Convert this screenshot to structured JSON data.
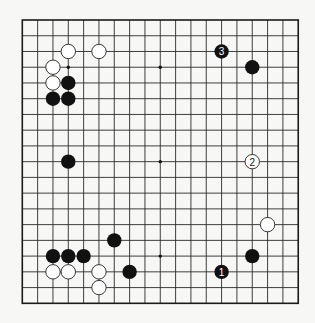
{
  "board": {
    "size": 19,
    "origin_x": 22.3,
    "origin_y": 20.0,
    "spacing_x": 15.33,
    "spacing_y": 15.74,
    "stone_radius": 7.2,
    "colors": {
      "background": "#f7f7f5",
      "line": "#2a2a2a",
      "black_stone": "#111111",
      "white_stone": "#ffffff"
    },
    "star_points": [
      [
        3,
        3
      ],
      [
        9,
        3
      ],
      [
        15,
        3
      ],
      [
        3,
        9
      ],
      [
        9,
        9
      ],
      [
        15,
        9
      ],
      [
        3,
        15
      ],
      [
        9,
        15
      ],
      [
        15,
        15
      ]
    ]
  },
  "stones": [
    {
      "color": "white",
      "col": 3,
      "row": 2,
      "label": ""
    },
    {
      "color": "white",
      "col": 5,
      "row": 2,
      "label": ""
    },
    {
      "color": "white",
      "col": 2,
      "row": 3,
      "label": ""
    },
    {
      "color": "white",
      "col": 2,
      "row": 4,
      "label": ""
    },
    {
      "color": "black",
      "col": 3,
      "row": 4,
      "label": ""
    },
    {
      "color": "black",
      "col": 2,
      "row": 5,
      "label": ""
    },
    {
      "color": "black",
      "col": 3,
      "row": 5,
      "label": ""
    },
    {
      "color": "black",
      "col": 13,
      "row": 2,
      "label": "3"
    },
    {
      "color": "black",
      "col": 15,
      "row": 3,
      "label": ""
    },
    {
      "color": "black",
      "col": 3,
      "row": 9,
      "label": ""
    },
    {
      "color": "white",
      "col": 15,
      "row": 9,
      "label": "2"
    },
    {
      "color": "white",
      "col": 16,
      "row": 13,
      "label": ""
    },
    {
      "color": "black",
      "col": 6,
      "row": 14,
      "label": ""
    },
    {
      "color": "black",
      "col": 2,
      "row": 15,
      "label": ""
    },
    {
      "color": "black",
      "col": 3,
      "row": 15,
      "label": ""
    },
    {
      "color": "black",
      "col": 4,
      "row": 15,
      "label": ""
    },
    {
      "color": "black",
      "col": 15,
      "row": 15,
      "label": ""
    },
    {
      "color": "white",
      "col": 2,
      "row": 16,
      "label": ""
    },
    {
      "color": "white",
      "col": 3,
      "row": 16,
      "label": ""
    },
    {
      "color": "white",
      "col": 5,
      "row": 16,
      "label": ""
    },
    {
      "color": "black",
      "col": 7,
      "row": 16,
      "label": ""
    },
    {
      "color": "black",
      "col": 13,
      "row": 16,
      "label": "1"
    },
    {
      "color": "white",
      "col": 5,
      "row": 17,
      "label": ""
    }
  ]
}
